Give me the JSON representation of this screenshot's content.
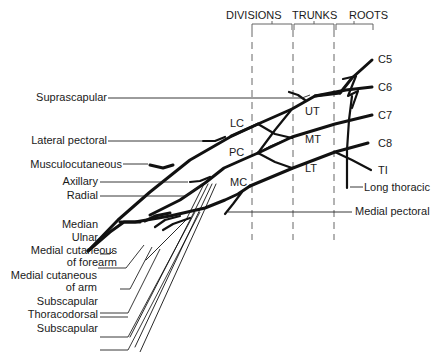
{
  "header": {
    "divisions": "DIVISIONS",
    "trunks": "TRUNKS",
    "roots": "ROOTS"
  },
  "roots": {
    "c5": "C5",
    "c6": "C6",
    "c7": "C7",
    "c8": "C8",
    "t1": "TI"
  },
  "trunks": {
    "upper": "UT",
    "middle": "MT",
    "lower": "LT"
  },
  "cords": {
    "lateral": "LC",
    "posterior": "PC",
    "medial": "MC"
  },
  "nerves_left": {
    "suprascapular": "Suprascapular",
    "lateral_pectoral": "Lateral pectoral",
    "musculocutaneous": "Musculocutaneous",
    "axillary": "Axillary",
    "radial": "Radial",
    "median": "Median",
    "ulnar": "Ulnar",
    "medial_cut_forearm_1": "Medial cutaneous",
    "medial_cut_forearm_2": "of forearm",
    "medial_cut_arm_1": "Medial cutaneous",
    "medial_cut_arm_2": "of arm",
    "subscapular_upper": "Subscapular",
    "thoracodorsal": "Thoracodorsal",
    "subscapular_lower": "Subscapular"
  },
  "nerves_right": {
    "long_thoracic": "Long thoracic",
    "medial_pectoral": "Medial pectoral"
  }
}
